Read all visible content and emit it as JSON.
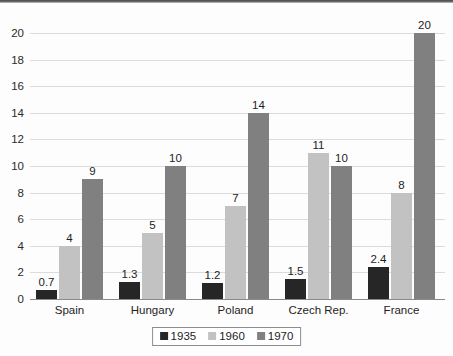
{
  "chart_data": {
    "type": "bar",
    "title": "",
    "xlabel": "",
    "ylabel": "",
    "ylim": [
      0,
      20
    ],
    "ytick_step": 2,
    "yticks": [
      "20",
      "18",
      "16",
      "14",
      "12",
      "10",
      "8",
      "6",
      "4",
      "2",
      "0"
    ],
    "grid": true,
    "legend_position": "bottom-center",
    "categories": [
      "Spain",
      "Hungary",
      "Poland",
      "Czech Rep.",
      "France"
    ],
    "series": [
      {
        "name": "1935",
        "color": "#262626",
        "values": [
          0.7,
          1.3,
          1.2,
          1.5,
          2.4
        ],
        "labels": [
          "0.7",
          "1.3",
          "1.2",
          "1.5",
          "2.4"
        ]
      },
      {
        "name": "1960",
        "color": "#c2c2c2",
        "values": [
          4,
          5,
          7,
          11,
          8
        ],
        "labels": [
          "4",
          "5",
          "7",
          "11",
          "8"
        ]
      },
      {
        "name": "1970",
        "color": "#808080",
        "values": [
          9,
          10,
          14,
          10,
          20
        ],
        "labels": [
          "9",
          "10",
          "14",
          "10",
          "20"
        ]
      }
    ]
  },
  "colors": {
    "background": "#fdfdfd",
    "gridline": "#dcdcdc",
    "axis": "#8a8a8a",
    "text": "#1d1d1d",
    "series_1935": "#262626",
    "series_1960": "#c2c2c2",
    "series_1970": "#808080"
  }
}
